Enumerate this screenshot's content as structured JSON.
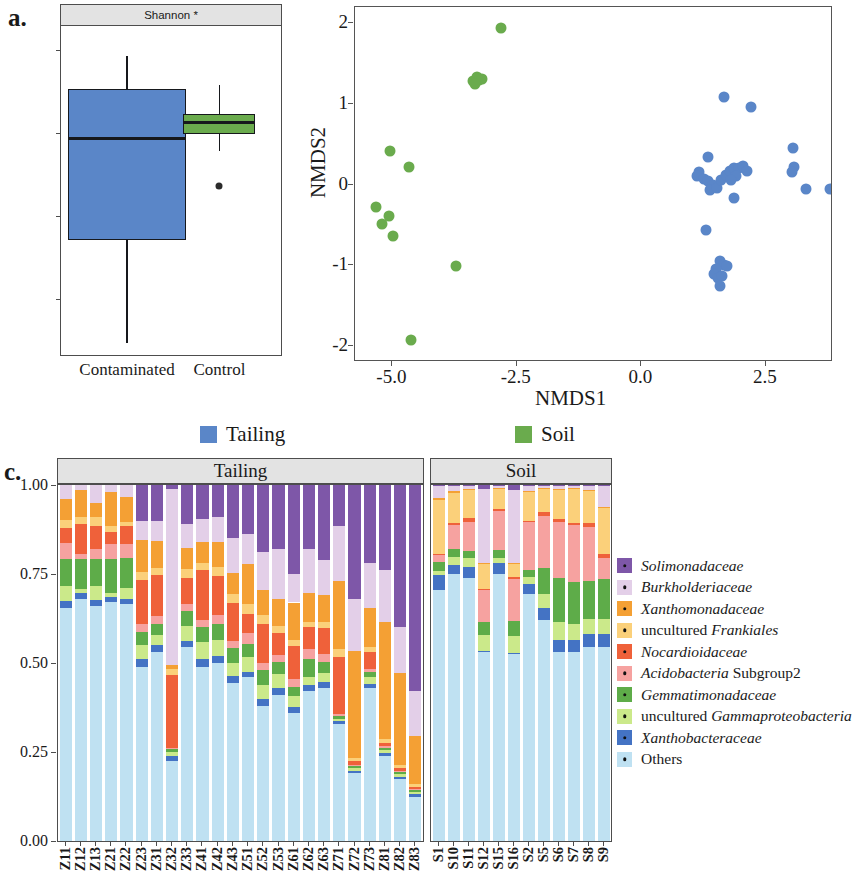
{
  "panel_a": {
    "letter": "a.",
    "strip_title": "Shannon *",
    "y_ticks": [
      "6",
      "5",
      "4",
      "3"
    ],
    "y_values": [
      6,
      5,
      4,
      3
    ],
    "x_categories": [
      "Contaminated",
      "Control"
    ],
    "boxes": [
      {
        "group": "Contaminated",
        "color": "#5a86c8",
        "min": 2.47,
        "q1": 3.72,
        "median": 4.94,
        "q3": 5.53,
        "max": 5.93,
        "outliers": []
      },
      {
        "group": "Control",
        "color": "#6aab4d",
        "min": 4.79,
        "q1": 4.99,
        "median": 5.13,
        "q3": 5.23,
        "max": 5.58,
        "outliers": [
          4.37
        ]
      }
    ]
  },
  "panel_b": {
    "letter": "b.",
    "xlabel": "NMDS1",
    "ylabel": "NMDS2",
    "x_ticks": [
      "-5.0",
      "-2.5",
      "0.0",
      "2.5"
    ],
    "x_tick_values": [
      -5.0,
      -2.5,
      0.0,
      2.5
    ],
    "y_ticks": [
      "2",
      "1",
      "0",
      "-1",
      "-2"
    ],
    "y_tick_values": [
      2,
      1,
      0,
      -1,
      -2
    ],
    "xlim": [
      -5.75,
      3.85
    ],
    "ylim": [
      -2.2,
      2.2
    ],
    "series": [
      {
        "name": "Soil",
        "color": "#6aab4d",
        "points": [
          [
            -2.82,
            1.94
          ],
          [
            -3.38,
            1.28
          ],
          [
            -3.3,
            1.33
          ],
          [
            -3.25,
            1.3
          ],
          [
            -3.19,
            1.31
          ],
          [
            -3.34,
            1.24
          ],
          [
            -5.05,
            0.41
          ],
          [
            -4.66,
            0.22
          ],
          [
            -5.33,
            -0.28
          ],
          [
            -5.07,
            -0.39
          ],
          [
            -5.21,
            -0.49
          ],
          [
            -4.99,
            -0.64
          ],
          [
            -3.72,
            -1.01
          ],
          [
            -4.62,
            -1.93
          ]
        ]
      },
      {
        "name": "Tailing",
        "color": "#5a86c8",
        "points": [
          [
            1.66,
            1.09
          ],
          [
            2.21,
            0.96
          ],
          [
            3.05,
            0.45
          ],
          [
            3.06,
            0.22
          ],
          [
            3.02,
            0.15
          ],
          [
            3.3,
            -0.06
          ],
          [
            3.78,
            -0.05
          ],
          [
            1.34,
            0.34
          ],
          [
            1.16,
            0.15
          ],
          [
            1.12,
            0.1
          ],
          [
            1.25,
            0.07
          ],
          [
            1.33,
            0.04
          ],
          [
            1.43,
            0.0
          ],
          [
            1.37,
            -0.07
          ],
          [
            1.52,
            -0.04
          ],
          [
            1.6,
            0.06
          ],
          [
            1.7,
            0.12
          ],
          [
            1.78,
            0.17
          ],
          [
            1.87,
            0.2
          ],
          [
            1.96,
            0.21
          ],
          [
            2.04,
            0.23
          ],
          [
            2.12,
            0.17
          ],
          [
            1.9,
            0.1
          ],
          [
            1.81,
            0.05
          ],
          [
            1.86,
            -0.17
          ],
          [
            1.29,
            -0.56
          ],
          [
            1.58,
            -0.95
          ],
          [
            1.66,
            -1.0
          ],
          [
            1.73,
            -1.01
          ],
          [
            1.51,
            -1.05
          ],
          [
            1.46,
            -1.11
          ],
          [
            1.55,
            -1.16
          ],
          [
            1.63,
            -1.13
          ],
          [
            1.58,
            -1.26
          ]
        ]
      }
    ]
  },
  "group_legend": {
    "items": [
      {
        "label": "Tailing",
        "color": "#5a86c8"
      },
      {
        "label": "Soil",
        "color": "#6aab4d"
      }
    ]
  },
  "panel_c": {
    "letter": "c.",
    "facets": [
      "Tailing",
      "Soil"
    ],
    "y_ticks": [
      "1.00",
      "0.75",
      "0.50",
      "0.25",
      "0.00"
    ],
    "y_tick_values": [
      1.0,
      0.75,
      0.5,
      0.25,
      0.0
    ],
    "ylim": [
      0,
      1
    ],
    "taxa": [
      {
        "label": "Solimonadaceae",
        "italic": true,
        "color": "#7e57a8"
      },
      {
        "label": "Burkholderiaceae",
        "italic": true,
        "color": "#e3cfe8"
      },
      {
        "label": "Xanthomonadaceae",
        "italic": true,
        "color": "#f4a034"
      },
      {
        "label": "uncultured Frankiales",
        "italic": false,
        "italic_part": "Frankiales",
        "color": "#fbd07a"
      },
      {
        "label": "Nocardioidaceae",
        "italic": true,
        "color": "#ef613a"
      },
      {
        "label": "Acidobacteria Subgroup2",
        "italic": false,
        "italic_part": "Acidobacteria",
        "color": "#f6a2a0"
      },
      {
        "label": "Gemmatimonadaceae",
        "italic": true,
        "color": "#5eac49"
      },
      {
        "label": "uncultured Gammaproteobacteria",
        "italic": false,
        "italic_part": "Gammaproteobacteria",
        "color": "#cbe98a"
      },
      {
        "label": "Xanthobacteraceae",
        "italic": true,
        "color": "#4473c4"
      },
      {
        "label": "Others",
        "italic": false,
        "color": "#bfe1f2"
      }
    ],
    "tailing_samples": [
      "Z11",
      "Z12",
      "Z13",
      "Z21",
      "Z22",
      "Z23",
      "Z31",
      "Z32",
      "Z33",
      "Z41",
      "Z42",
      "Z43",
      "Z51",
      "Z52",
      "Z53",
      "Z61",
      "Z62",
      "Z63",
      "Z71",
      "Z72",
      "Z73",
      "Z81",
      "Z82",
      "Z83"
    ],
    "soil_samples": [
      "S1",
      "S10",
      "S11",
      "S12",
      "S15",
      "S16",
      "S2",
      "S5",
      "S6",
      "S7",
      "S8",
      "S9"
    ]
  },
  "chart_data": {
    "type": "bar",
    "xlabel": "",
    "ylabel": "Relative abundance",
    "ylim": [
      0,
      1
    ],
    "stacked": true,
    "series_order": [
      "Others",
      "Xanthobacteraceae",
      "uncultured Gammaproteobacteria",
      "Gemmatimonadaceae",
      "Acidobacteria Subgroup2",
      "Nocardioidaceae",
      "uncultured Frankiales",
      "Xanthomonadaceae",
      "Burkholderiaceae",
      "Solimonadaceae"
    ],
    "facets": [
      {
        "name": "Tailing",
        "categories": [
          "Z11",
          "Z12",
          "Z13",
          "Z21",
          "Z22",
          "Z23",
          "Z31",
          "Z32",
          "Z33",
          "Z41",
          "Z42",
          "Z43",
          "Z51",
          "Z52",
          "Z53",
          "Z61",
          "Z62",
          "Z63",
          "Z71",
          "Z72",
          "Z73",
          "Z81",
          "Z82",
          "Z83"
        ],
        "series": [
          {
            "name": "Others",
            "values": [
              0.655,
              0.68,
              0.66,
              0.67,
              0.665,
              0.49,
              0.53,
              0.225,
              0.545,
              0.49,
              0.5,
              0.445,
              0.46,
              0.38,
              0.41,
              0.36,
              0.42,
              0.43,
              0.33,
              0.19,
              0.43,
              0.24,
              0.175,
              0.125
            ]
          },
          {
            "name": "Xanthobacteraceae",
            "values": [
              0.02,
              0.018,
              0.016,
              0.016,
              0.015,
              0.022,
              0.02,
              0.015,
              0.018,
              0.02,
              0.02,
              0.018,
              0.016,
              0.018,
              0.02,
              0.016,
              0.018,
              0.018,
              0.006,
              0.006,
              0.012,
              0.006,
              0.006,
              0.006
            ]
          },
          {
            "name": "uncultured Gammaproteobacteria",
            "values": [
              0.042,
              0.01,
              0.04,
              0.012,
              0.03,
              0.04,
              0.03,
              0.01,
              0.04,
              0.05,
              0.045,
              0.038,
              0.04,
              0.04,
              0.038,
              0.03,
              0.022,
              0.024,
              0.008,
              0.008,
              0.02,
              0.01,
              0.006,
              0.006
            ]
          },
          {
            "name": "Gemmatimonadaceae",
            "values": [
              0.075,
              0.085,
              0.075,
              0.095,
              0.085,
              0.035,
              0.03,
              0.008,
              0.042,
              0.04,
              0.045,
              0.04,
              0.038,
              0.042,
              0.035,
              0.028,
              0.05,
              0.03,
              0.008,
              0.006,
              0.014,
              0.006,
              0.006,
              0.006
            ]
          },
          {
            "name": "Acidobacteria Subgroup2",
            "values": [
              0.045,
              0.012,
              0.03,
              0.04,
              0.04,
              0.022,
              0.022,
              0.004,
              0.02,
              0.022,
              0.024,
              0.022,
              0.03,
              0.02,
              0.02,
              0.02,
              0.03,
              0.022,
              0.004,
              0.004,
              0.006,
              0.004,
              0.004,
              0.004
            ]
          },
          {
            "name": "Nocardioidaceae",
            "values": [
              0.043,
              0.085,
              0.065,
              0.035,
              0.05,
              0.125,
              0.115,
              0.205,
              0.075,
              0.14,
              0.11,
              0.105,
              0.055,
              0.11,
              0.06,
              0.095,
              0.06,
              0.075,
              0.16,
              0.01,
              0.05,
              0.01,
              0.008,
              0.006
            ]
          },
          {
            "name": "uncultured Frankiales",
            "values": [
              0.022,
              0.02,
              0.024,
              0.016,
              0.012,
              0.022,
              0.02,
              0.016,
              0.024,
              0.018,
              0.026,
              0.026,
              0.028,
              0.024,
              0.022,
              0.016,
              0.016,
              0.016,
              0.024,
              0.01,
              0.012,
              0.01,
              0.008,
              0.008
            ]
          },
          {
            "name": "Xanthomonadaceae",
            "values": [
              0.058,
              0.075,
              0.04,
              0.095,
              0.07,
              0.09,
              0.075,
              0.012,
              0.06,
              0.06,
              0.07,
              0.06,
              0.11,
              0.07,
              0.075,
              0.105,
              0.08,
              0.075,
              0.19,
              0.3,
              0.11,
              0.33,
              0.26,
              0.135
            ]
          },
          {
            "name": "Burkholderiaceae",
            "values": [
              0.068,
              0.035,
              0.066,
              0.036,
              0.046,
              0.054,
              0.058,
              0.495,
              0.066,
              0.065,
              0.07,
              0.096,
              0.085,
              0.108,
              0.14,
              0.08,
              0.124,
              0.1,
              0.155,
              0.146,
              0.126,
              0.144,
              0.127,
              0.124
            ]
          },
          {
            "name": "Solimonadaceae",
            "values": [
              0.032,
              0.03,
              0.032,
              0.03,
              0.03,
              0.12,
              0.11,
              0.02,
              0.13,
              0.115,
              0.11,
              0.16,
              0.145,
              0.198,
              0.195,
              0.26,
              0.2,
              0.22,
              0.125,
              0.33,
              0.23,
              0.25,
              0.41,
              0.59
            ]
          }
        ]
      },
      {
        "name": "Soil",
        "categories": [
          "S1",
          "S10",
          "S11",
          "S12",
          "S15",
          "S16",
          "S2",
          "S5",
          "S6",
          "S7",
          "S8",
          "S9"
        ],
        "series": [
          {
            "name": "Others",
            "values": [
              0.705,
              0.75,
              0.74,
              0.53,
              0.75,
              0.525,
              0.695,
              0.62,
              0.53,
              0.53,
              0.545,
              0.545
            ]
          },
          {
            "name": "Xanthobacteraceae",
            "values": [
              0.042,
              0.025,
              0.03,
              0.004,
              0.03,
              0.004,
              0.028,
              0.035,
              0.035,
              0.035,
              0.036,
              0.036
            ]
          },
          {
            "name": "uncultured Gammaproteobacteria",
            "values": [
              0.012,
              0.022,
              0.024,
              0.046,
              0.016,
              0.046,
              0.018,
              0.04,
              0.05,
              0.044,
              0.042,
              0.044
            ]
          },
          {
            "name": "Gemmatimonadaceae",
            "values": [
              0.024,
              0.022,
              0.022,
              0.036,
              0.022,
              0.042,
              0.02,
              0.072,
              0.125,
              0.118,
              0.108,
              0.11
            ]
          },
          {
            "name": "Acidobacteria Subgroup2",
            "values": [
              0.02,
              0.07,
              0.08,
              0.088,
              0.11,
              0.12,
              0.135,
              0.145,
              0.155,
              0.162,
              0.15,
              0.06
            ]
          },
          {
            "name": "Nocardioidaceae",
            "values": [
              0.004,
              0.004,
              0.01,
              0.004,
              0.004,
              0.004,
              0.004,
              0.012,
              0.01,
              0.004,
              0.012,
              0.01
            ]
          },
          {
            "name": "uncultured Frankiales",
            "values": [
              0.15,
              0.085,
              0.08,
              0.07,
              0.056,
              0.036,
              0.08,
              0.064,
              0.08,
              0.095,
              0.09,
              0.13
            ]
          },
          {
            "name": "Xanthomonadaceae",
            "values": [
              0.006,
              0.004,
              0.004,
              0.004,
              0.004,
              0.004,
              0.004,
              0.004,
              0.004,
              0.004,
              0.004,
              0.004
            ]
          },
          {
            "name": "Burkholderiaceae",
            "values": [
              0.033,
              0.014,
              0.006,
              0.208,
              0.004,
              0.205,
              0.012,
              0.004,
              0.007,
              0.004,
              0.009,
              0.057
            ]
          },
          {
            "name": "Solimonadaceae",
            "values": [
              0.004,
              0.004,
              0.004,
              0.01,
              0.004,
              0.014,
              0.004,
              0.004,
              0.004,
              0.004,
              0.004,
              0.004
            ]
          }
        ]
      }
    ]
  }
}
